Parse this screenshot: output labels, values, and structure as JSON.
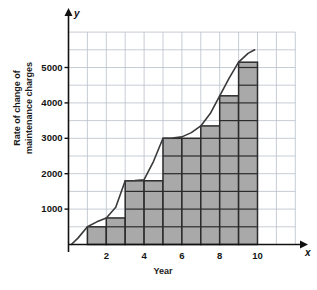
{
  "chart_data": {
    "type": "bar",
    "title": "",
    "subtitle": "",
    "xlabel": "Year",
    "ylabel": "Rate of change of maintenance charges",
    "x_axis_name": "x",
    "y_axis_name": "y",
    "grid": true,
    "grid_step_x": 1,
    "grid_step_y": 500,
    "legend": "none",
    "xlim": [
      0,
      12
    ],
    "ylim": [
      0,
      6000
    ],
    "xticks": [
      2,
      4,
      6,
      8,
      10
    ],
    "xtick_labels": [
      "2",
      "4",
      "6",
      "8",
      "10"
    ],
    "yticks": [
      1000,
      2000,
      3000,
      4000,
      5000
    ],
    "ytick_labels": [
      "1000",
      "2000",
      "3000",
      "4000",
      "5000"
    ],
    "bar_edges": [
      1,
      2,
      3,
      4,
      5,
      6,
      7,
      8,
      9,
      10
    ],
    "categories": [
      "1-2",
      "2-3",
      "3-4",
      "4-5",
      "5-6",
      "6-7",
      "7-8",
      "8-9",
      "9-10"
    ],
    "values": [
      500,
      750,
      1800,
      1800,
      3000,
      3000,
      3350,
      4200,
      5150
    ],
    "bar_fill": "#a9a9a9",
    "bar_stroke": "#2b2b2b",
    "grid_color": "#b9c0cc",
    "axis_color": "#111111",
    "curve_color": "#3a3a3a",
    "series": [
      {
        "name": "Riemann rectangles (left endpoints)",
        "values": [
          500,
          750,
          1800,
          1800,
          3000,
          3000,
          3350,
          4200,
          5150
        ]
      },
      {
        "name": "rate curve",
        "x": [
          0.15,
          0.5,
          1.0,
          1.5,
          2.0,
          2.5,
          3.0,
          3.5,
          4.0,
          4.5,
          5.0,
          5.5,
          6.0,
          6.5,
          7.0,
          7.5,
          8.0,
          8.5,
          9.0,
          9.5,
          9.85
        ],
        "y": [
          0,
          180,
          500,
          640,
          750,
          1050,
          1800,
          1810,
          1830,
          2350,
          3000,
          3010,
          3040,
          3160,
          3350,
          3700,
          4200,
          4700,
          5150,
          5400,
          5500
        ]
      }
    ]
  },
  "labels": {
    "x_axis_name": "x",
    "y_axis_name": "y",
    "x_axis_title": "Year",
    "y_axis_title_line1": "Rate of change of",
    "y_axis_title_line2": "maintenance charges"
  }
}
